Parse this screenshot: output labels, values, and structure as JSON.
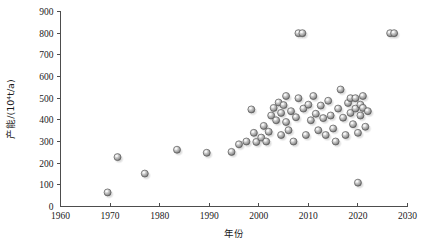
{
  "chart_data": {
    "type": "scatter",
    "title": "",
    "xlabel": "年份",
    "ylabel": "产能/(10⁴t/a)",
    "xlim": [
      1960,
      2030
    ],
    "ylim": [
      0,
      900
    ],
    "xticks": [
      1960,
      1970,
      1980,
      1990,
      2000,
      2010,
      2020,
      2030
    ],
    "yticks": [
      0,
      100,
      200,
      300,
      400,
      500,
      600,
      700,
      800,
      900
    ],
    "xtick_labels": [
      "1960",
      "1970",
      "1980",
      "1990",
      "2000",
      "2010",
      "2020",
      "2030"
    ],
    "ytick_labels": [
      "0",
      "100",
      "200",
      "300",
      "400",
      "500",
      "600",
      "700",
      "800",
      "900"
    ],
    "grid": false,
    "legend": null,
    "marker": {
      "shape": "circle",
      "style": "3d-sphere",
      "fill": "#b8b8b8",
      "edge": "#595959",
      "highlight": "#f0f0f0",
      "shadow": "#aaaaaa",
      "size_px": 7
    },
    "series": [
      {
        "name": "产能",
        "points": [
          [
            1969.5,
            65
          ],
          [
            1971.5,
            228
          ],
          [
            1977.0,
            152
          ],
          [
            1983.5,
            262
          ],
          [
            1989.5,
            248
          ],
          [
            1994.5,
            252
          ],
          [
            1996.0,
            287
          ],
          [
            1997.5,
            300
          ],
          [
            1998.5,
            448
          ],
          [
            1999.0,
            340
          ],
          [
            1999.5,
            298
          ],
          [
            2000.5,
            318
          ],
          [
            2001.0,
            372
          ],
          [
            2001.5,
            300
          ],
          [
            2002.0,
            345
          ],
          [
            2002.5,
            420
          ],
          [
            2003.0,
            455
          ],
          [
            2003.5,
            398
          ],
          [
            2004.0,
            480
          ],
          [
            2004.5,
            432
          ],
          [
            2004.5,
            330
          ],
          [
            2005.0,
            468
          ],
          [
            2005.5,
            510
          ],
          [
            2005.5,
            390
          ],
          [
            2006.0,
            352
          ],
          [
            2006.5,
            440
          ],
          [
            2007.0,
            300
          ],
          [
            2007.5,
            412
          ],
          [
            2008.0,
            500
          ],
          [
            2008.0,
            800
          ],
          [
            2008.8,
            800
          ],
          [
            2009.0,
            452
          ],
          [
            2009.5,
            330
          ],
          [
            2010.0,
            470
          ],
          [
            2010.5,
            398
          ],
          [
            2011.0,
            510
          ],
          [
            2011.5,
            428
          ],
          [
            2012.0,
            352
          ],
          [
            2012.5,
            466
          ],
          [
            2013.0,
            408
          ],
          [
            2013.5,
            330
          ],
          [
            2014.0,
            488
          ],
          [
            2014.5,
            420
          ],
          [
            2015.0,
            360
          ],
          [
            2015.5,
            300
          ],
          [
            2016.0,
            452
          ],
          [
            2016.5,
            540
          ],
          [
            2017.0,
            410
          ],
          [
            2017.5,
            330
          ],
          [
            2018.0,
            478
          ],
          [
            2018.5,
            432
          ],
          [
            2018.5,
            500
          ],
          [
            2019.0,
            380
          ],
          [
            2019.5,
            452
          ],
          [
            2019.5,
            500
          ],
          [
            2020.0,
            110
          ],
          [
            2020.0,
            340
          ],
          [
            2020.5,
            470
          ],
          [
            2020.5,
            420
          ],
          [
            2021.0,
            510
          ],
          [
            2021.0,
            455
          ],
          [
            2021.5,
            368
          ],
          [
            2022.0,
            440
          ],
          [
            2026.5,
            800
          ],
          [
            2027.3,
            800
          ]
        ]
      }
    ]
  },
  "axes": {
    "x_axis_name": "年份",
    "y_axis_name": "产能/(10⁴t/a)"
  }
}
